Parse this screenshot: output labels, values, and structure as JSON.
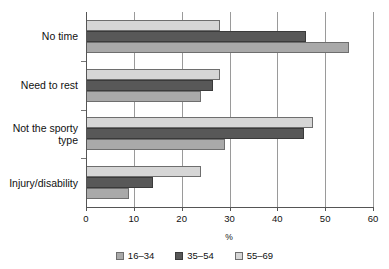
{
  "chart_data": {
    "type": "bar",
    "orientation": "horizontal",
    "title": "",
    "xlabel": "%",
    "ylabel": "",
    "xlim": [
      0,
      60
    ],
    "xticks": [
      0,
      10,
      20,
      30,
      40,
      50,
      60
    ],
    "xticklabels": [
      "0",
      "10",
      "20",
      "30",
      "40",
      "50",
      "60"
    ],
    "grid": true,
    "grid_axis": "x",
    "legend_position": "bottom",
    "categories": [
      "No time",
      "Need to rest",
      "Not the sporty\ntype",
      "Injury/disability"
    ],
    "series": [
      {
        "name": "16–34",
        "color": "#a9a9a9",
        "values": [
          55,
          24,
          29,
          9
        ]
      },
      {
        "name": "35–54",
        "color": "#585858",
        "values": [
          46,
          26.5,
          45.5,
          14
        ]
      },
      {
        "name": "55–69",
        "color": "#d6d6d6",
        "values": [
          28,
          28,
          47.5,
          24
        ]
      }
    ]
  },
  "legend": {
    "items": [
      {
        "label": "16–34"
      },
      {
        "label": "35–54"
      },
      {
        "label": "55–69"
      }
    ]
  },
  "axis": {
    "x_title": "%"
  }
}
